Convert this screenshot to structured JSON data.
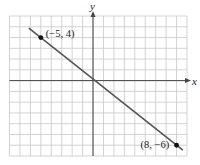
{
  "chart_data": {
    "type": "line",
    "title": "",
    "xlabel": "x",
    "ylabel": "y",
    "xlim": [
      -8,
      9
    ],
    "ylim": [
      -7,
      6
    ],
    "grid": true,
    "grid_step": 1,
    "series": [
      {
        "name": "line through (-5, 4) and (8, -6)",
        "x": [
          -5,
          8
        ],
        "y": [
          4,
          -6
        ],
        "color": "#555555"
      }
    ],
    "points": [
      {
        "x": -5,
        "y": 4,
        "label": "(−5, 4)"
      },
      {
        "x": 8,
        "y": -6,
        "label": "(8, −6)"
      }
    ]
  },
  "axes": {
    "x_label": "x",
    "y_label": "y"
  },
  "annotations": {
    "p1": "(−5, 4)",
    "p2": "(8, −6)"
  },
  "colors": {
    "grid": "#c8c8c8",
    "axis": "#444444",
    "line": "#555555",
    "point": "#111111",
    "background": "#ffffff"
  }
}
